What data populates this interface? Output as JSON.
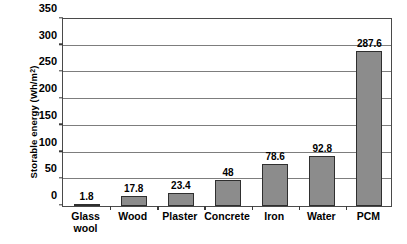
{
  "chart_data": {
    "type": "bar",
    "title": "",
    "xlabel": "",
    "ylabel": "Storable energy (Wh/m²)",
    "ylabel_base": "Storable energy (Wh/m",
    "ylabel_sup": "2",
    "ylabel_tail": ")",
    "categories": [
      "Glass\nwool",
      "Wood",
      "Plaster",
      "Concrete",
      "Iron",
      "Water",
      "PCM"
    ],
    "values": [
      1.8,
      17.8,
      23.4,
      48,
      78.6,
      92.8,
      287.6
    ],
    "value_labels": [
      "1.8",
      "17.8",
      "23.4",
      "48",
      "78.6",
      "92.8",
      "287.6"
    ],
    "ylim": [
      0,
      350
    ],
    "yticks": [
      0,
      50,
      100,
      150,
      200,
      250,
      300,
      350
    ],
    "ytick_labels": [
      "0",
      "50",
      "100",
      "150",
      "200",
      "250",
      "300",
      "350"
    ],
    "grid": true,
    "legend": "none",
    "bar_color": "#8c8c8c",
    "bar_edge_color": "#2f2f2f",
    "grid_color": "#7d7d7d",
    "axis_color": "#4a4a4a",
    "background": "#ffffff"
  }
}
